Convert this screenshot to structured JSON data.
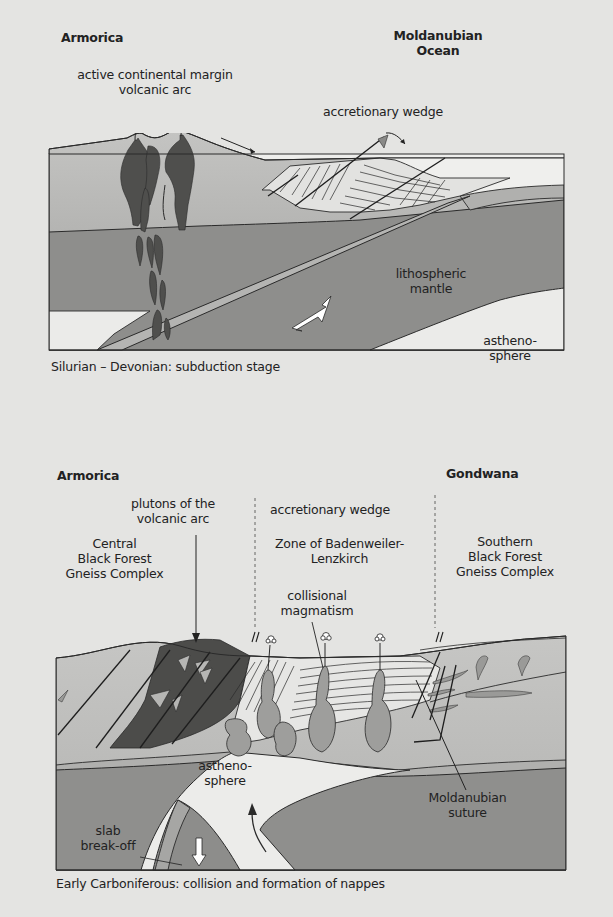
{
  "panels": [
    {
      "id": "subduction",
      "caption": "Silurian – Devonian: subduction stage",
      "labels": {
        "left_plate": "Armorica",
        "right_plate_line1": "Moldanubian",
        "right_plate_line2": "Ocean",
        "arc_line1": "active continental margin",
        "arc_line2": "volcanic arc",
        "wedge": "accretionary wedge",
        "mantle_line1": "lithospheric",
        "mantle_line2": "mantle",
        "astheno_line1": "astheno-",
        "astheno_line2": "sphere"
      },
      "arrows": [
        "plate-motion-arrow",
        "slab-descent-arrow",
        "wedge-thrust-arrow"
      ]
    },
    {
      "id": "collision",
      "caption": "Early Carboniferous: collision and formation of nappes",
      "labels": {
        "left_plate": "Armorica",
        "right_plate": "Gondwana",
        "plutons_line1": "plutons of the",
        "plutons_line2": "volcanic arc",
        "central_line1": "Central",
        "central_line2": "Black Forest",
        "central_line3": "Gneiss Complex",
        "wedge": "accretionary wedge",
        "zone_line1": "Zone of Badenweiler-",
        "zone_line2": "Lenzkirch",
        "collisional_line1": "collisional",
        "collisional_line2": "magmatism",
        "southern_line1": "Southern",
        "southern_line2": "Black Forest",
        "southern_line3": "Gneiss Complex",
        "astheno_line1": "astheno-",
        "astheno_line2": "sphere",
        "slab_line1": "slab",
        "slab_line2": "break-off",
        "suture_line1": "Moldanubian",
        "suture_line2": "suture"
      }
    }
  ],
  "colors": {
    "background": "#e4e4e2",
    "crust": "#b9b9b7",
    "crust_light": "#c8c8c6",
    "mantle": "#8f8f8d",
    "asthenosphere": "#ececea",
    "ocean": "#efefed",
    "pluton": "#4f4f4d",
    "slab": "#a9a9a7",
    "magma": "#9c9c9a",
    "line": "#2a2a2a"
  }
}
